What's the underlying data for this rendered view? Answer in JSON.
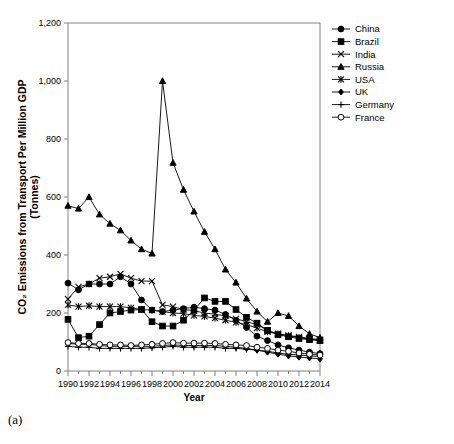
{
  "caption": "(a)",
  "chart_data": {
    "type": "line",
    "title": "",
    "xlabel": "Year",
    "ylabel": "CO₂ Emissions  from Transport Per Million GDP (Tonnes)",
    "ylabel_line1": "CO₂ Emissions  from Transport Per Million GDP",
    "ylabel_line2": "(Tonnes)",
    "grid": false,
    "legend_position": "right",
    "xlim": [
      1990,
      2014
    ],
    "ylim": [
      0,
      1200
    ],
    "ytick_step": 200,
    "xtick_step": 2,
    "minor_xticks": true,
    "x": [
      1990,
      1991,
      1992,
      1993,
      1994,
      1995,
      1996,
      1997,
      1998,
      1999,
      2000,
      2001,
      2002,
      2003,
      2004,
      2005,
      2006,
      2007,
      2008,
      2009,
      2010,
      2011,
      2012,
      2013,
      2014
    ],
    "xtick_labels": [
      "1990",
      "1992",
      "1994",
      "1996",
      "1998",
      "2000",
      "2002",
      "2004",
      "2006",
      "2008",
      "2010",
      "2012",
      "2014"
    ],
    "ytick_labels": [
      "0",
      "200",
      "400",
      "600",
      "800",
      "1,000",
      "1,200"
    ],
    "series": [
      {
        "name": "China",
        "marker": "filled-circle",
        "values": [
          303,
          280,
          300,
          300,
          300,
          325,
          300,
          245,
          210,
          205,
          210,
          215,
          220,
          215,
          210,
          195,
          175,
          150,
          120,
          105,
          90,
          80,
          72,
          65,
          60
        ]
      },
      {
        "name": "Brazil",
        "marker": "filled-square",
        "values": [
          178,
          115,
          120,
          160,
          200,
          205,
          210,
          212,
          170,
          155,
          155,
          175,
          210,
          252,
          240,
          240,
          212,
          185,
          165,
          140,
          125,
          118,
          112,
          108,
          105
        ]
      },
      {
        "name": "India",
        "marker": "cross",
        "values": [
          248,
          290,
          300,
          320,
          325,
          335,
          320,
          310,
          310,
          228,
          222,
          212,
          208,
          200,
          196,
          190,
          180,
          170,
          160,
          140,
          128,
          122,
          118,
          112,
          108
        ]
      },
      {
        "name": "Russia",
        "marker": "filled-triangle",
        "values": [
          570,
          560,
          600,
          540,
          508,
          485,
          450,
          420,
          405,
          1000,
          718,
          625,
          550,
          480,
          420,
          350,
          305,
          250,
          205,
          170,
          200,
          190,
          155,
          128,
          115
        ]
      },
      {
        "name": "USA",
        "marker": "star",
        "values": [
          228,
          222,
          225,
          222,
          222,
          222,
          218,
          212,
          210,
          205,
          200,
          198,
          192,
          188,
          182,
          175,
          168,
          160,
          148,
          135,
          128,
          122,
          115,
          110,
          105
        ]
      },
      {
        "name": "UK",
        "marker": "small-diamond",
        "values": [
          95,
          92,
          92,
          88,
          85,
          85,
          85,
          85,
          85,
          88,
          90,
          88,
          88,
          88,
          88,
          85,
          82,
          78,
          72,
          65,
          58,
          52,
          48,
          45,
          42
        ]
      },
      {
        "name": "Germany",
        "marker": "plus",
        "values": [
          85,
          82,
          82,
          78,
          78,
          78,
          78,
          78,
          80,
          82,
          85,
          82,
          82,
          82,
          82,
          78,
          78,
          75,
          72,
          68,
          62,
          58,
          55,
          52,
          50
        ]
      },
      {
        "name": "France",
        "marker": "open-circle",
        "values": [
          98,
          95,
          95,
          92,
          90,
          90,
          88,
          90,
          92,
          95,
          98,
          96,
          96,
          96,
          95,
          92,
          90,
          88,
          82,
          78,
          72,
          68,
          62,
          58,
          55
        ]
      }
    ]
  }
}
